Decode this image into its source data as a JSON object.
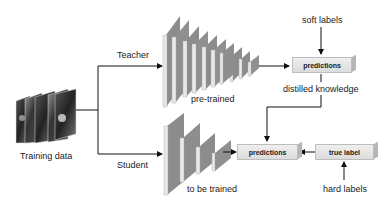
{
  "diagram": {
    "nodes": {
      "training_data": {
        "label": "Training data"
      },
      "teacher": {
        "branch_label": "Teacher",
        "network_label": "pre-trained",
        "layers": 10
      },
      "student": {
        "branch_label": "Student",
        "network_label": "to be trained",
        "layers": 4
      },
      "teacher_predictions": {
        "label": "predictions"
      },
      "student_predictions": {
        "label": "predictions"
      },
      "true_label": {
        "label": "true label"
      }
    },
    "annotations": {
      "soft_labels": "soft labels",
      "distilled_knowledge": "distilled knowledge",
      "hard_labels": "hard labels"
    },
    "edges": [
      {
        "from": "training_data",
        "to": "teacher",
        "label": "Teacher"
      },
      {
        "from": "training_data",
        "to": "student",
        "label": "Student"
      },
      {
        "from": "teacher",
        "to": "teacher_predictions"
      },
      {
        "from": "soft_labels",
        "to": "teacher_predictions"
      },
      {
        "from": "teacher_predictions",
        "to": "student_predictions",
        "label": "distilled knowledge"
      },
      {
        "from": "student",
        "to": "student_predictions"
      },
      {
        "from": "true_label",
        "to": "student_predictions"
      },
      {
        "from": "hard_labels",
        "to": "true_label"
      }
    ],
    "colors": {
      "layer_face": "#8c8c8c",
      "layer_front": "#e6e6e6",
      "box_fill": "#e4e4e4",
      "line": "#111111"
    }
  }
}
